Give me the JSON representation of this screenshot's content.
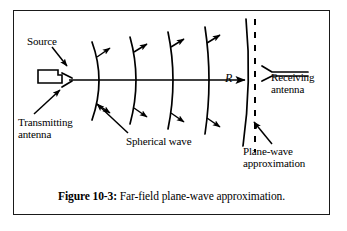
{
  "figure": {
    "caption_prefix": "Figure 10-3:",
    "caption_text": " Far-field plane-wave approximation.",
    "border_color": "#1a1a1a",
    "ink_color": "#000000",
    "background_color": "#ffffff"
  },
  "labels": {
    "source": "Source",
    "transmitting_antenna_line1": "Transmitting",
    "transmitting_antenna_line2": "antenna",
    "spherical_wave": "Spherical wave",
    "receiving_antenna_line1": "Receiving",
    "receiving_antenna_line2": "antenna",
    "plane_wave_line1": "Plane-wave",
    "plane_wave_line2": "approximation",
    "distance_symbol": "R"
  },
  "diagram": {
    "type": "schematic",
    "title": "Far-field plane-wave approximation",
    "axis": {
      "name": "propagation-axis",
      "y": 80,
      "x_start": 69,
      "x_end": 248,
      "arrow_at": 244
    },
    "transmitting_antenna": {
      "shape": "rectangular-waveguide-with-flare",
      "x": 38,
      "y": 70,
      "width": 24,
      "height": 13
    },
    "spherical_wavefronts": [
      {
        "index": 1,
        "apex_x": 98,
        "curvature": 26,
        "half_height": 40
      },
      {
        "index": 2,
        "apex_x": 134,
        "curvature": 20,
        "half_height": 44
      },
      {
        "index": 3,
        "apex_x": 170,
        "curvature": 15,
        "half_height": 50
      },
      {
        "index": 4,
        "apex_x": 206,
        "curvature": 11,
        "half_height": 55
      },
      {
        "index": 5,
        "apex_x": 247,
        "curvature": 7,
        "half_height": 62
      }
    ],
    "wavefront_arrow_count_per_front": 2,
    "plane_wave_line": {
      "style": "dashed",
      "x": 255,
      "y_top": 19,
      "y_bottom": 152
    },
    "receiving_antenna": {
      "shape": "horn-opening-left",
      "x": 262,
      "y": 66,
      "length": 46
    },
    "leaders": [
      {
        "name": "source-leader",
        "from": [
          55,
          47
        ],
        "to": [
          69,
          66
        ]
      },
      {
        "name": "transmitting-leader",
        "from": [
          36,
          114
        ],
        "to": [
          62,
          90
        ]
      },
      {
        "name": "spherical-leader",
        "from": [
          128,
          133
        ],
        "to": [
          95,
          105
        ]
      },
      {
        "name": "planewave-leader",
        "from": [
          272,
          144
        ],
        "to": [
          252,
          123
        ]
      }
    ]
  }
}
